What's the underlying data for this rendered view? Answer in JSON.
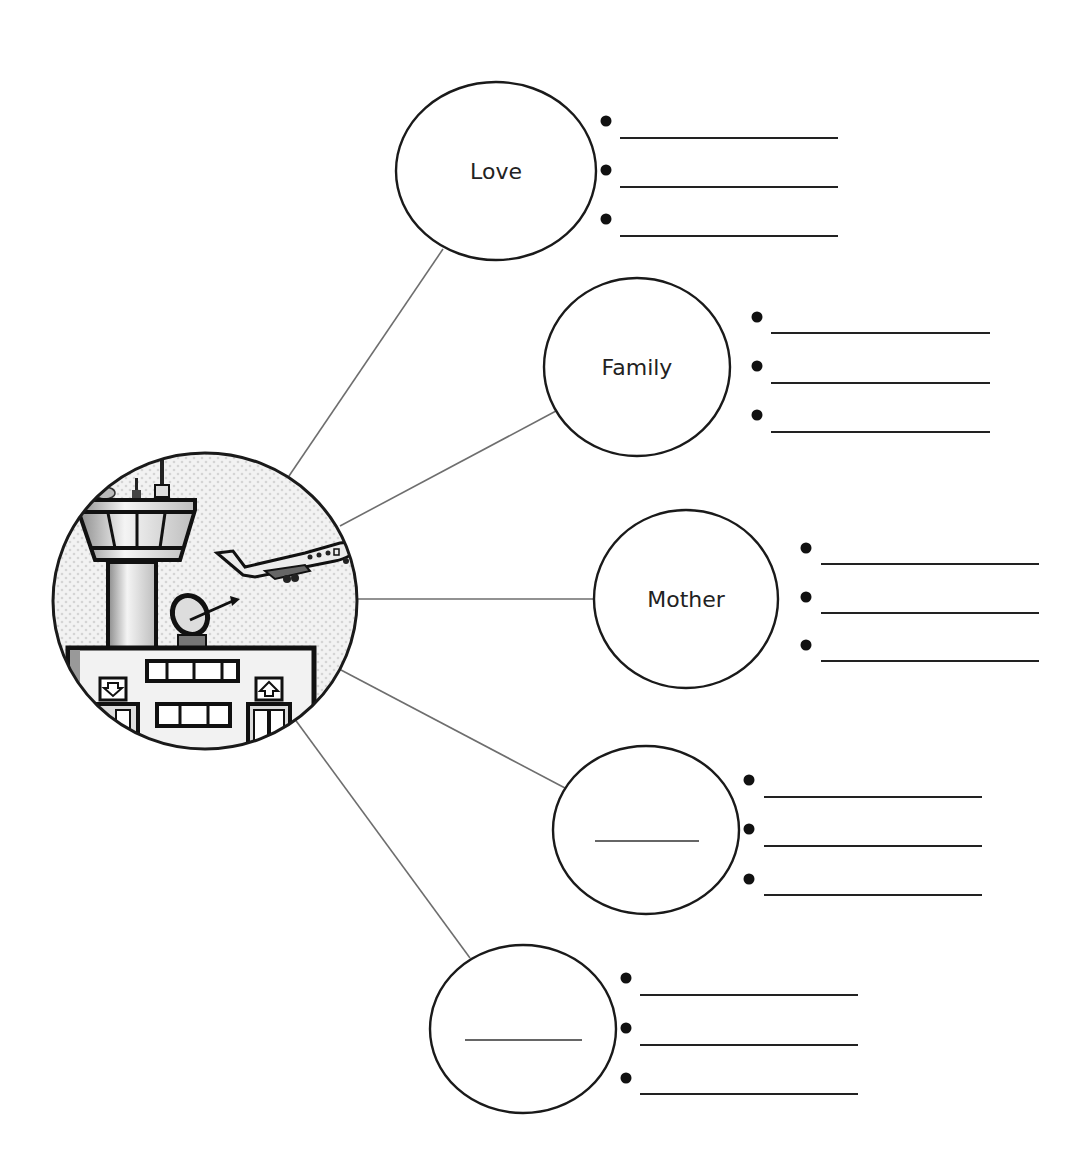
{
  "worksheet": {
    "type": "word-web",
    "hub": {
      "icon": "airport-control-tower-icon",
      "description": "Airport scene: control tower, airplane taking off, radar dish, terminal building with arrival/departure signs"
    },
    "nodes": [
      {
        "label": "Love",
        "bullets": 3,
        "blank_label": false
      },
      {
        "label": "Family",
        "bullets": 3,
        "blank_label": false
      },
      {
        "label": "Mother",
        "bullets": 3,
        "blank_label": false
      },
      {
        "label": "",
        "bullets": 3,
        "blank_label": true
      },
      {
        "label": "",
        "bullets": 3,
        "blank_label": true
      }
    ]
  },
  "colors": {
    "stroke": "#1a1a1a",
    "connector": "#6e6e6e",
    "hub_fill": "#ececec",
    "background": "#ffffff"
  }
}
